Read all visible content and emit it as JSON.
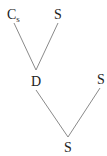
{
  "diagram": {
    "type": "tree",
    "nodes": [
      {
        "id": "n1",
        "label": "C",
        "subscript": "s",
        "x": 11,
        "y": 18
      },
      {
        "id": "n2",
        "label": "S",
        "x": 58,
        "y": 18
      },
      {
        "id": "n3",
        "label": "D",
        "x": 36,
        "y": 85
      },
      {
        "id": "n4",
        "label": "S",
        "x": 101,
        "y": 83
      },
      {
        "id": "n5",
        "label": "S",
        "x": 68,
        "y": 151
      }
    ],
    "edges": [
      {
        "from": "n1",
        "to": "n3"
      },
      {
        "from": "n2",
        "to": "n3"
      },
      {
        "from": "n3",
        "to": "n5"
      },
      {
        "from": "n4",
        "to": "n5"
      }
    ],
    "colors": {
      "edge": "#8a8a8a",
      "text": "#222222"
    }
  }
}
